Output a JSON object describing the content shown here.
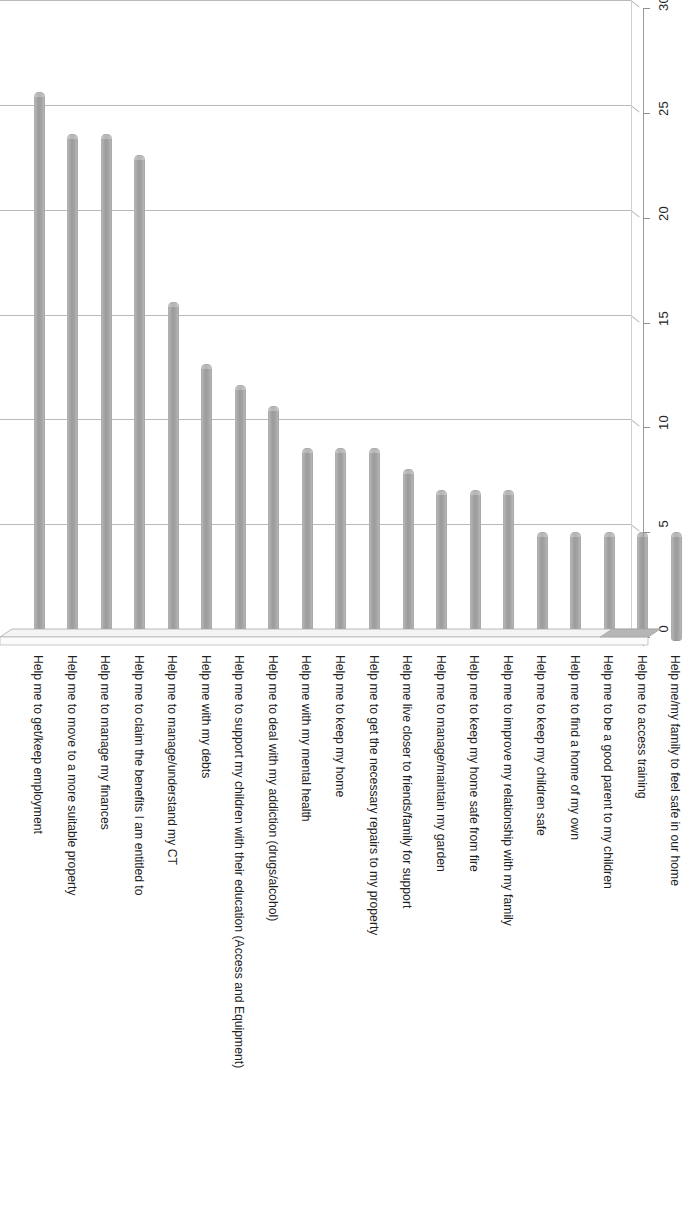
{
  "chart_data": {
    "type": "bar",
    "title": "",
    "subtitle": "",
    "xlabel": "",
    "ylabel": "",
    "orientation": "vertical",
    "grid": true,
    "legend": false,
    "style": "3d-cylinder",
    "bar_color": "#a0a0a0",
    "ylim": [
      0,
      30
    ],
    "ytick_step": 5,
    "yticks": [
      0,
      5,
      10,
      15,
      20,
      25,
      30
    ],
    "ytick_labels": [
      "0",
      "5",
      "10",
      "15",
      "20",
      "25",
      "30"
    ],
    "value_axis_position": "right",
    "category_axis_position": "bottom",
    "categories": [
      "Help me to get/keep employment",
      "Help me to move to a more suitable property",
      "Help me to manage my finances",
      "Help me to claim the benefits I am entitled to",
      "Help me to manage/understand my CT",
      "Help me with my debts",
      "Help me to support my children with their education (Access and Equipment)",
      "Help me to deal with my addiction (drugs/alcohol)",
      "Help me with my mental health",
      "Help me to keep my home",
      "Help me to get the necessary repairs to my property",
      "Help me live closer to friends/family for support",
      "Help me to manage/maintain my garden",
      "Help me to keep my home safe from fire",
      "Help me to improve my relationship with my family",
      "Help me to keep my children safe",
      "Help me to find a home of my own",
      "Help me to be a good parent to my children",
      "Help me to access training",
      "Help me/my family to feel safe in our home"
    ],
    "values": [
      26,
      24,
      24,
      23,
      16,
      13,
      12,
      11,
      9,
      9,
      9,
      8,
      7,
      7,
      7,
      5,
      5,
      5,
      5,
      5
    ]
  }
}
